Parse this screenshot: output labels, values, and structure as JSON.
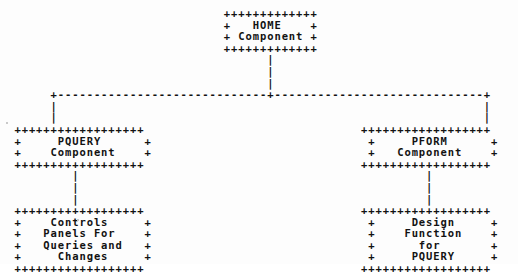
{
  "diagram": {
    "style": "ascii-art",
    "border_char": "+",
    "vertical_connector_char": "|",
    "horizontal_connector_char": "-",
    "text_color": "#121212",
    "background_color": "#fdfdfd",
    "nodes": [
      {
        "id": "home",
        "name": "home-component-box",
        "lines": [
          "HOME",
          "Component"
        ],
        "border_width_chars": 13,
        "level": 0,
        "position": "center"
      },
      {
        "id": "pquery",
        "name": "pquery-component-box",
        "lines": [
          "PQUERY",
          "Component"
        ],
        "border_width_chars": 18,
        "level": 1,
        "position": "left"
      },
      {
        "id": "pform",
        "name": "pform-component-box",
        "lines": [
          "PFORM",
          "Component"
        ],
        "border_width_chars": 18,
        "level": 1,
        "position": "right"
      },
      {
        "id": "pquery-detail",
        "name": "controls-panels-box",
        "lines": [
          "Controls",
          "Panels For",
          "Queries and",
          "Changes"
        ],
        "border_width_chars": 18,
        "level": 2,
        "position": "left"
      },
      {
        "id": "pform-detail",
        "name": "design-function-box",
        "lines": [
          "Design",
          "Function",
          "for",
          "PQUERY"
        ],
        "border_width_chars": 18,
        "level": 2,
        "position": "right"
      }
    ],
    "edges": [
      {
        "from": "home",
        "to": "pquery",
        "style": "dashed"
      },
      {
        "from": "home",
        "to": "pform",
        "style": "dashed"
      },
      {
        "from": "pquery",
        "to": "pquery-detail",
        "style": "dashed"
      },
      {
        "from": "pform",
        "to": "pform-detail",
        "style": "dashed"
      }
    ],
    "canvas": "                               +++++++++++++\n                               +   HOME    +\n                               + Component +\n                               +++++++++++++\n                                     |\n                                     |\n                                     |\n       +-----------------------------+-----------------------------+\n       |                                                           |\n       |                                                           |\n  ++++++++++++++++++                              ++++++++++++++++++\n  +     PQUERY      +                              +     PFORM      +\n  +    Component    +                              +   Component    +\n  ++++++++++++++++++                              ++++++++++++++++++\n          |                                                |\n          |                                                |\n          |                                                |\n  ++++++++++++++++++                              ++++++++++++++++++\n  +    Controls     +                              +     Design     +\n  +   Panels For    +                              +    Function    +\n  +   Queries and   +                              +      for       +\n  +     Changes     +                              +     PQUERY     +\n  ++++++++++++++++++                              ++++++++++++++++++"
  }
}
